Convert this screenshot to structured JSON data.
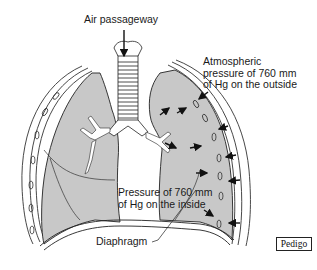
{
  "figure": {
    "labels": {
      "air_passageway": "Air passageway",
      "atmospheric_line1": "Atmospheric",
      "atmospheric_line2": "pressure of 760 mm",
      "atmospheric_line3": "of Hg on the outside",
      "inside_line1": "Pressure of 760 mm",
      "inside_line2": "of Hg on the inside",
      "diaphragm": "Diaphragm"
    },
    "credit": "Pedigo",
    "colors": {
      "lung_fill": "#c8c8c8",
      "outline": "#222222",
      "background": "#ffffff"
    },
    "arrows": {
      "outside_count": 5,
      "inside_count": 6,
      "air_arrow": "down"
    }
  }
}
